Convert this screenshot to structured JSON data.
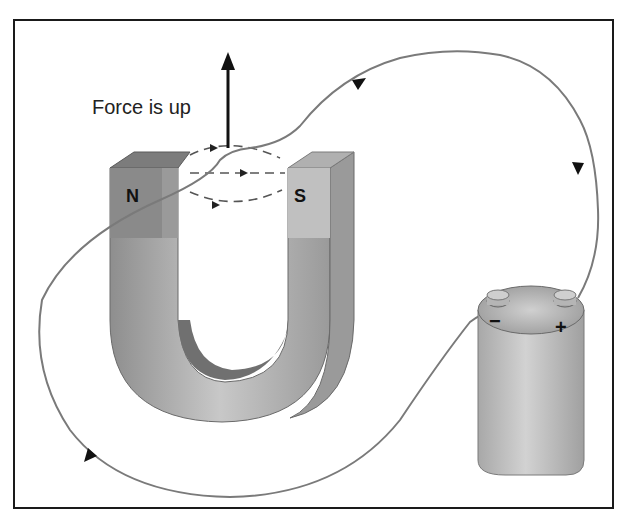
{
  "diagram": {
    "force_label": "Force is up",
    "magnet": {
      "north_label": "N",
      "south_label": "S",
      "shape": "horseshoe (U) magnet"
    },
    "battery": {
      "negative_label": "−",
      "positive_label": "+"
    },
    "field_lines": "dashed, directed from N to S",
    "current_direction": "from + terminal, over the wire between the poles, around, back to − terminal",
    "colors": {
      "border": "#1a1a1a",
      "wire": "#7a7a7a",
      "magnet_dark": "#8a8a8a",
      "magnet_light": "#c4c4c4",
      "battery": "#b9b9b9"
    }
  }
}
